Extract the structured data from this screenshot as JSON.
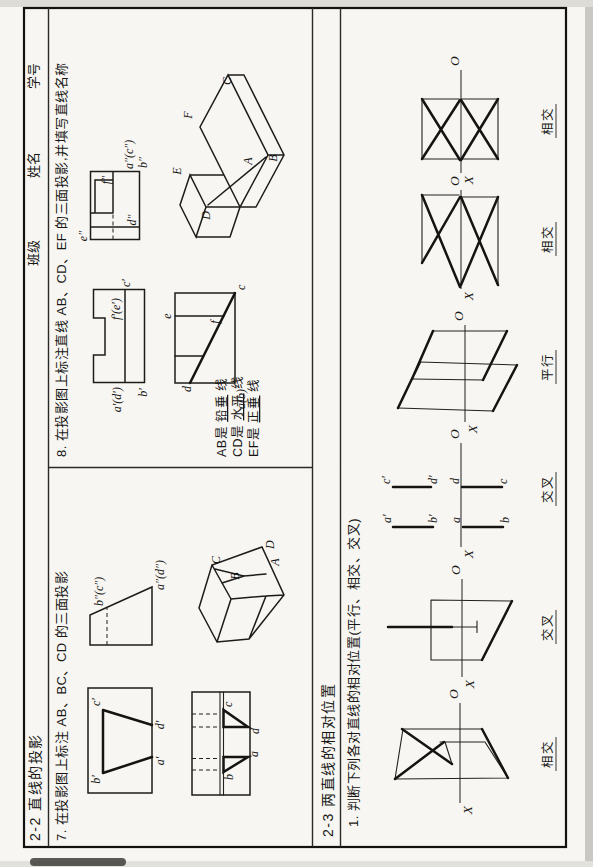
{
  "page": {
    "title": "2-2 直线的投影",
    "class_label": "班级",
    "name_label": "姓名",
    "student_id_label": "学号",
    "section": {
      "title": "2-3 两直线的相对位置",
      "question": "1. 判断下列各对直线的相对位置(平行、相交、交叉)"
    }
  },
  "q7": {
    "text": "7. 在投影图上标注 AB、BC、CD 的三面投影",
    "front": {
      "b": "b′",
      "c": "c′",
      "a": "a′",
      "d": "d′"
    },
    "side": {
      "bc": "b″(c″)",
      "ad": "a″(d″)"
    },
    "top": {
      "b": "b",
      "a": "a",
      "c": "c",
      "d": "d"
    },
    "axon": {
      "a": "A",
      "b": "B",
      "c": "C",
      "d": "D"
    }
  },
  "q8": {
    "text": "8. 在投影图上标注直线 AB、CD、EF 的三面投影,并填写直线名称",
    "front": {
      "fe": "f′(e′)",
      "ad": "a′(d′)",
      "b": "b′",
      "c": "c′"
    },
    "side": {
      "e": "e″",
      "f": "f″",
      "d": "d″",
      "ac": "a″(c″)",
      "b": "b″"
    },
    "top": {
      "e": "e",
      "f": "f",
      "d": "d",
      "c": "c",
      "ab": "a(b)"
    },
    "axon": {
      "e": "E",
      "d": "D",
      "f": "F",
      "a": "A",
      "b": "B",
      "c": "C"
    },
    "answers": [
      {
        "prefix": "AB是",
        "answer": "铅垂",
        "suffix": "线"
      },
      {
        "prefix": "CD是",
        "answer": "水平",
        "suffix": "线"
      },
      {
        "prefix": "EF是",
        "answer": "正垂",
        "suffix": "线"
      }
    ]
  },
  "relpos": {
    "figures": [
      {
        "x": "X",
        "o": "O",
        "answer": "相交"
      },
      {
        "x": "X",
        "o": "O",
        "answer": "交叉"
      },
      {
        "x": "X",
        "o": "O",
        "answer": "交叉"
      },
      {
        "x": "X",
        "o": "O",
        "answer": "平行"
      },
      {
        "x": "X",
        "o": "O",
        "answer": "相交"
      },
      {
        "x": "X",
        "o": "O",
        "answer": "相交"
      }
    ],
    "fig3_labels": {
      "a1": "a′",
      "b1": "b′",
      "c1": "c′",
      "d1": "d′",
      "a": "a",
      "b": "b",
      "d": "d",
      "c": "c"
    }
  }
}
